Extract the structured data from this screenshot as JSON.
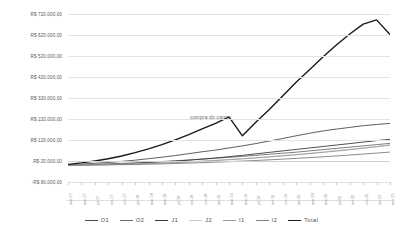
{
  "chart_data": {
    "type": "line",
    "title": "",
    "xlabel": "",
    "ylabel": "",
    "grid": true,
    "legend_position": "bottom",
    "ylim": [
      -80000,
      720000
    ],
    "y_ticks": [
      720000,
      620000,
      520000,
      420000,
      320000,
      220000,
      120000,
      20000,
      -80000
    ],
    "y_tick_labels": [
      "R$ 720.000,00",
      "R$ 620.000,00",
      "R$ 520.000,00",
      "R$ 420.000,00",
      "R$ 320.000,00",
      "R$ 220.000,00",
      "R$ 120.000,00",
      "R$ 20.000,00",
      "-R$ 80.000,00"
    ],
    "x_tick_labels": [
      "mar-17",
      "mai-17",
      "jul-17",
      "set-17",
      "nov-17",
      "jan-18",
      "mar-18",
      "mai-18",
      "jul-18",
      "set-18",
      "nov-18",
      "jan-19",
      "mar-19",
      "mai-19",
      "jul-19",
      "set-19",
      "nov-19",
      "jan-20",
      "mar-20",
      "mai-20",
      "jul-20",
      "set-20",
      "nov-20",
      "jan-21",
      "mar-21"
    ],
    "annotations": [
      {
        "text": "compra do carro",
        "x_index": 13,
        "y": 230000
      }
    ],
    "series": [
      {
        "name": "O1",
        "color": "#4d4d4d",
        "width": 0.9,
        "values": [
          2000,
          5000,
          9000,
          13000,
          18000,
          24000,
          31000,
          38000,
          46000,
          55000,
          64000,
          72000,
          82000,
          92000,
          103000,
          115000,
          127000,
          140000,
          152000,
          163000,
          172000,
          180000,
          188000,
          194000,
          199000
        ]
      },
      {
        "name": "O2",
        "color": "#6e6e6e",
        "width": 0.9,
        "values": [
          1000,
          2500,
          4000,
          6000,
          8500,
          11000,
          14000,
          17500,
          21000,
          25000,
          29000,
          33000,
          37500,
          42000,
          47000,
          52000,
          57000,
          62000,
          68000,
          74000,
          80000,
          86000,
          92000,
          98000,
          104000
        ]
      },
      {
        "name": "J1",
        "color": "#3a3a3a",
        "width": 0.9,
        "values": [
          500,
          1500,
          3000,
          4500,
          6500,
          9000,
          12000,
          15500,
          19500,
          24000,
          29000,
          34500,
          40500,
          47000,
          54000,
          61000,
          68000,
          75000,
          82000,
          89000,
          96000,
          103000,
          110000,
          117000,
          123000
        ]
      },
      {
        "name": "J2",
        "color": "#c9c9c9",
        "width": 0.9,
        "values": [
          300,
          900,
          1800,
          3000,
          4500,
          6300,
          8400,
          10800,
          13500,
          16500,
          19800,
          23400,
          27300,
          31500,
          36000,
          40800,
          45900,
          51300,
          57000,
          63000,
          69300,
          75900,
          82800,
          90000,
          97500
        ]
      },
      {
        "name": "I1",
        "color": "#9a9a9a",
        "width": 0.9,
        "values": [
          200,
          700,
          1500,
          2600,
          4000,
          5700,
          7700,
          10000,
          12600,
          15500,
          18700,
          22200,
          26000,
          30100,
          34500,
          39200,
          44200,
          49500,
          55100,
          61000,
          67200,
          73700,
          80500,
          87600,
          95000
        ]
      },
      {
        "name": "I2",
        "color": "#7f7f7f",
        "width": 0.9,
        "values": [
          100,
          400,
          900,
          1600,
          2500,
          3600,
          4900,
          6400,
          8100,
          10000,
          12100,
          14400,
          16900,
          19600,
          22500,
          25600,
          28900,
          32400,
          36100,
          40000,
          44100,
          48400,
          52900,
          57600,
          62500
        ]
      },
      {
        "name": "Total",
        "color": "#1a1a1a",
        "width": 1.4,
        "values": [
          4100,
          11000,
          20200,
          30700,
          44000,
          59600,
          78000,
          98200,
          120700,
          146000,
          172600,
          199500,
          230200,
          140000,
          205000,
          265000,
          330000,
          395000,
          455000,
          515000,
          572000,
          625000,
          672000,
          692000,
          622000
        ]
      }
    ]
  },
  "legend": {
    "items": [
      {
        "label": "O1",
        "color": "#4d4d4d",
        "width": 0.9
      },
      {
        "label": "O2",
        "color": "#6e6e6e",
        "width": 0.9
      },
      {
        "label": "J1",
        "color": "#3a3a3a",
        "width": 0.9
      },
      {
        "label": "J2",
        "color": "#c9c9c9",
        "width": 0.9
      },
      {
        "label": "I1",
        "color": "#9a9a9a",
        "width": 0.9
      },
      {
        "label": "I2",
        "color": "#7f7f7f",
        "width": 0.9
      },
      {
        "label": "Total",
        "color": "#1a1a1a",
        "width": 1.4
      }
    ]
  }
}
